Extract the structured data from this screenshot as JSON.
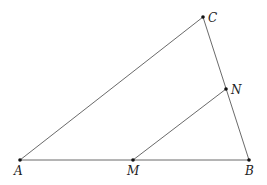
{
  "diagram": {
    "type": "triangle",
    "points": [
      {
        "id": "A",
        "label": "A"
      },
      {
        "id": "B",
        "label": "B"
      },
      {
        "id": "C",
        "label": "C"
      },
      {
        "id": "M",
        "label": "M"
      },
      {
        "id": "N",
        "label": "N"
      }
    ],
    "segments": [
      {
        "from": "A",
        "to": "B"
      },
      {
        "from": "B",
        "to": "C"
      },
      {
        "from": "C",
        "to": "A"
      },
      {
        "from": "M",
        "to": "N"
      }
    ],
    "relations": [
      "M on AB",
      "N on BC",
      "MN parallel to AC"
    ]
  }
}
